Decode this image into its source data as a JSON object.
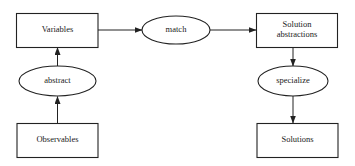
{
  "diagram": {
    "type": "flowchart",
    "colors": {
      "stroke": "#222222",
      "text": "#1a1a1a",
      "background": "#ffffff"
    },
    "nodes": [
      {
        "id": "variables",
        "shape": "rect",
        "label": "Variables"
      },
      {
        "id": "match",
        "shape": "ellipse",
        "label": "match"
      },
      {
        "id": "solution_abstractions",
        "shape": "rect",
        "label_line1": "Solution",
        "label_line2": "abstractions"
      },
      {
        "id": "abstract",
        "shape": "ellipse",
        "label": "abstract"
      },
      {
        "id": "specialize",
        "shape": "ellipse",
        "label": "specialize"
      },
      {
        "id": "observables",
        "shape": "rect",
        "label": "Observables"
      },
      {
        "id": "solutions",
        "shape": "rect",
        "label": "Solutions"
      }
    ],
    "edges": [
      {
        "from": "observables",
        "to": "abstract"
      },
      {
        "from": "abstract",
        "to": "variables"
      },
      {
        "from": "variables",
        "to": "match"
      },
      {
        "from": "match",
        "to": "solution_abstractions"
      },
      {
        "from": "solution_abstractions",
        "to": "specialize"
      },
      {
        "from": "specialize",
        "to": "solutions"
      }
    ]
  }
}
